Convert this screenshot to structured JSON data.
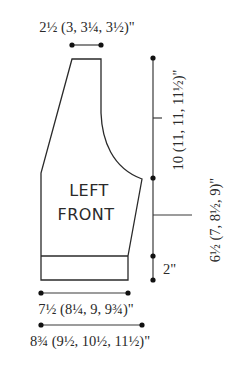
{
  "diagram": {
    "piece_label_line1": "LEFT",
    "piece_label_line2": "FRONT",
    "stroke_color": "#2a2a2a",
    "background": "#ffffff",
    "measurements": {
      "neck_width": "2½ (3, 3¼, 3½)\"",
      "armhole_depth": "10 (11, 11, 11½)\"",
      "side_length": "6½ (7, 8½, 9)\"",
      "ribbing_height": "2\"",
      "ribbing_width": "7½ (8¼, 9, 9¾)\"",
      "body_width": "8¾ (9½, 10½, 11½)\""
    }
  }
}
